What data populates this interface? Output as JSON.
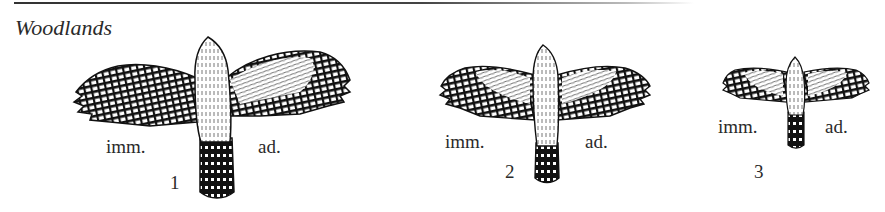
{
  "header": {
    "title": "Woodlands"
  },
  "figures": [
    {
      "number": "1",
      "left_label": "imm.",
      "right_label": "ad."
    },
    {
      "number": "2",
      "left_label": "imm.",
      "right_label": "ad."
    },
    {
      "number": "3",
      "left_label": "imm.",
      "right_label": "ad."
    }
  ],
  "colors": {
    "ink": "#1a1a1a",
    "paper": "#ffffff"
  }
}
